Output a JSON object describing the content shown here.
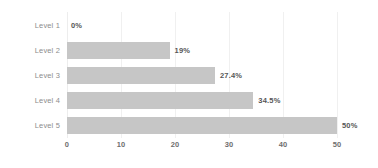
{
  "chart_data": {
    "type": "bar",
    "orientation": "horizontal",
    "title": "",
    "xlabel": "",
    "ylabel": "",
    "categories": [
      "Level 1",
      "Level 2",
      "Level 3",
      "Level 4",
      "Level 5"
    ],
    "values": [
      0,
      19,
      27.4,
      34.5,
      50
    ],
    "value_labels": [
      "0%",
      "19%",
      "27.4%",
      "34.5%",
      "50%"
    ],
    "xlim": [
      0,
      50
    ],
    "xticks": [
      0,
      10,
      20,
      30,
      40,
      50
    ],
    "xtick_labels": [
      "0",
      "10",
      "20",
      "30",
      "40",
      "50"
    ],
    "grid": true,
    "grid_axis": "x",
    "legend": false,
    "bar_color": "#c6c6c6",
    "value_label_color": "#565656",
    "category_label_color": "#8d8d8d",
    "tick_label_color": "#6e6e6e",
    "gridline_color": "#f0f0f0",
    "background_color": "#ffffff"
  }
}
